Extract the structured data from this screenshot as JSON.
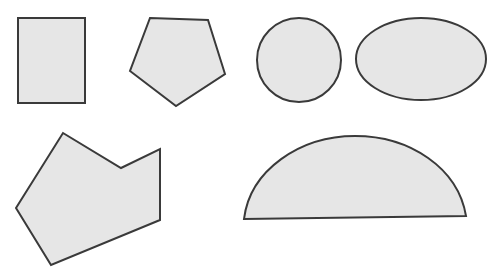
{
  "canvas": {
    "width": 495,
    "height": 275,
    "background": "#ffffff"
  },
  "style": {
    "fill": "#e6e6e6",
    "stroke": "#3a3a3a",
    "stroke_width": 2
  },
  "shapes": [
    {
      "id": "rectangle",
      "type": "rect",
      "x": 18,
      "y": 18,
      "width": 67,
      "height": 85
    },
    {
      "id": "pentagon",
      "type": "polygon",
      "points": "150,18 208,20 225,74 176,106 130,71"
    },
    {
      "id": "circle",
      "type": "circle",
      "cx": 299,
      "cy": 60,
      "r": 42
    },
    {
      "id": "ellipse",
      "type": "ellipse",
      "cx": 421,
      "cy": 59,
      "rx": 65,
      "ry": 41
    },
    {
      "id": "irregular-hexagon",
      "type": "polygon",
      "points": "63,133 121,168 160,149 160,220 51,265 16,208"
    },
    {
      "id": "semi-ellipse",
      "type": "path",
      "d": "M244,219 C250,170 300,136 355,136 C410,136 458,168 466,216 Z"
    }
  ]
}
